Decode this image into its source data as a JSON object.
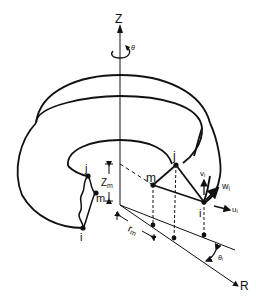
{
  "diagram": {
    "type": "axisymmetric toroidal solid with triangular ring element",
    "stroke_color": "#111111",
    "background": "#ffffff",
    "axes": {
      "vertical": "Z",
      "radial": "R",
      "rotation": "θ"
    },
    "nodes": [
      "i",
      "j",
      "m"
    ],
    "dimension_labels": {
      "z_m": {
        "base": "Z",
        "sub": "m"
      },
      "r_m": {
        "base": "r",
        "sub": "m"
      },
      "theta_i": {
        "base": "θ",
        "sub": "i"
      }
    },
    "displacements": {
      "u_i": {
        "base": "u",
        "sub": "i"
      },
      "v_i": {
        "base": "v",
        "sub": "i"
      },
      "w_i": {
        "base": "w",
        "sub": "i"
      }
    }
  }
}
